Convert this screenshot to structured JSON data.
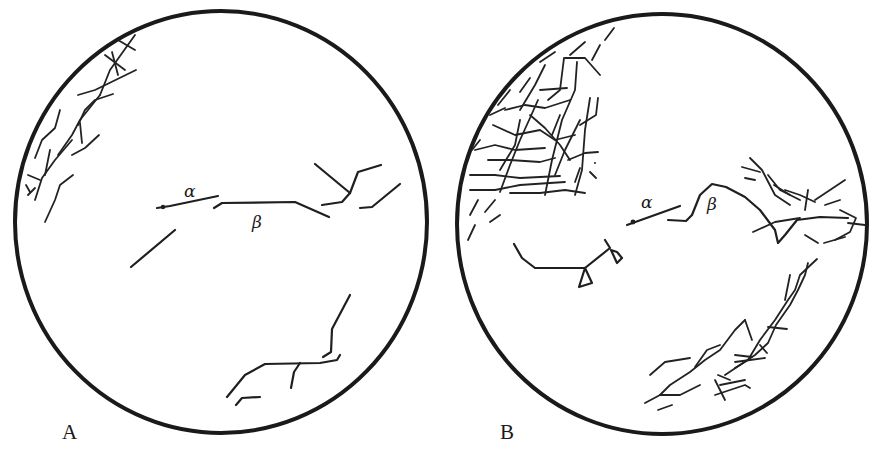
{
  "figure": {
    "panels": [
      {
        "id": "A",
        "label": "A",
        "fiber_labels": {
          "alpha": "α",
          "beta": "β"
        }
      },
      {
        "id": "B",
        "label": "B",
        "fiber_labels": {
          "alpha": "α",
          "beta": "β"
        }
      }
    ],
    "colors": {
      "ink": "#1a1a1a",
      "background": "#ffffff"
    }
  }
}
